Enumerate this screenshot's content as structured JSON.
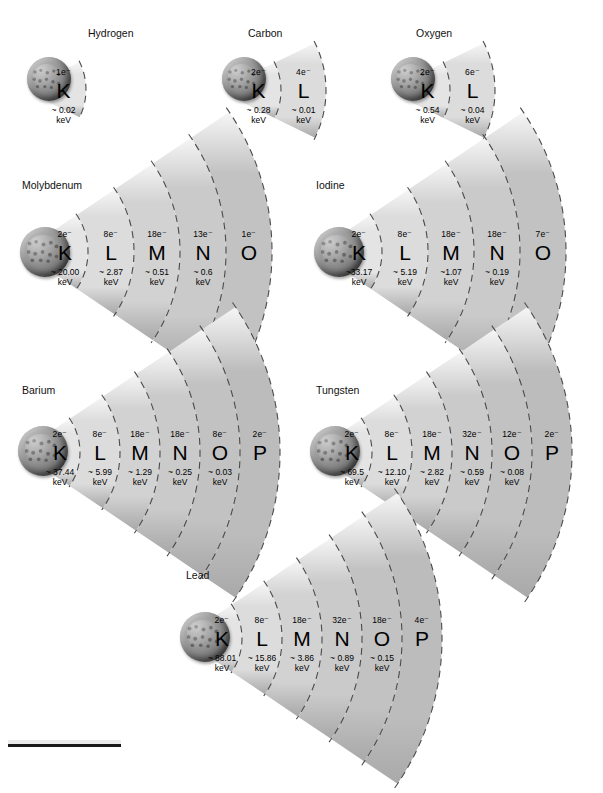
{
  "figure": {
    "type": "diagram",
    "units": "keV",
    "electron_symbol": "e⁻",
    "approx_symbol": "~",
    "energy_unit_label": "keV"
  },
  "elements": [
    {
      "name": "Hydrogen",
      "label_x": 88,
      "label_y": 28,
      "origin_x": 18,
      "origin_y": 92,
      "nucleus": {
        "x": 27,
        "y": 57,
        "size": 44
      },
      "fan": {
        "r_inner": 18,
        "r_step": 45,
        "half_angle": 26,
        "cx": 23,
        "cy": 90
      },
      "shells": [
        {
          "letter": "K",
          "electrons": "1e⁻",
          "energy": "~ 0.02",
          "unit": "keV"
        }
      ]
    },
    {
      "name": "Carbon",
      "label_x": 248,
      "label_y": 28,
      "origin_x": 178,
      "origin_y": 92,
      "nucleus": {
        "x": 222,
        "y": 57,
        "size": 44
      },
      "fan": {
        "r_inner": 18,
        "r_step": 45,
        "half_angle": 26,
        "cx": 218,
        "cy": 90
      },
      "shells": [
        {
          "letter": "K",
          "electrons": "2e⁻",
          "energy": "~ 0.28",
          "unit": "keV"
        },
        {
          "letter": "L",
          "electrons": "4e⁻",
          "energy": "~ 0.01",
          "unit": "keV"
        }
      ]
    },
    {
      "name": "Oxygen",
      "label_x": 416,
      "label_y": 28,
      "origin_x": 346,
      "origin_y": 92,
      "nucleus": {
        "x": 391,
        "y": 57,
        "size": 44
      },
      "fan": {
        "r_inner": 18,
        "r_step": 45,
        "half_angle": 26,
        "cx": 387,
        "cy": 90
      },
      "shells": [
        {
          "letter": "K",
          "electrons": "2e⁻",
          "energy": "~ 0.54",
          "unit": "keV"
        },
        {
          "letter": "L",
          "electrons": "6e⁻",
          "energy": "~ 0.04",
          "unit": "keV"
        }
      ]
    },
    {
      "name": "Molybdenum",
      "label_x": 22,
      "label_y": 180,
      "origin_x": 18,
      "origin_y": 262,
      "nucleus": {
        "x": 20,
        "y": 227,
        "size": 50
      },
      "fan": {
        "r_inner": 20,
        "r_step": 46,
        "half_angle": 34,
        "cx": 22,
        "cy": 252
      },
      "shells": [
        {
          "letter": "K",
          "electrons": "2e⁻",
          "energy": "~ 20.00",
          "unit": "keV"
        },
        {
          "letter": "L",
          "electrons": "8e⁻",
          "energy": "~ 2.87",
          "unit": "keV"
        },
        {
          "letter": "M",
          "electrons": "18e⁻",
          "energy": "~ 0.51",
          "unit": "keV"
        },
        {
          "letter": "N",
          "electrons": "13e⁻",
          "energy": "~ 0.6",
          "unit": "keV"
        },
        {
          "letter": "O",
          "electrons": "1e⁻",
          "energy": "",
          "unit": ""
        }
      ]
    },
    {
      "name": "Iodine",
      "label_x": 316,
      "label_y": 180,
      "origin_x": 312,
      "origin_y": 262,
      "nucleus": {
        "x": 314,
        "y": 227,
        "size": 50
      },
      "fan": {
        "r_inner": 20,
        "r_step": 46,
        "half_angle": 34,
        "cx": 316,
        "cy": 252
      },
      "shells": [
        {
          "letter": "K",
          "electrons": "2e⁻",
          "energy": "~33.17",
          "unit": "keV"
        },
        {
          "letter": "L",
          "electrons": "8e⁻",
          "energy": "~ 5.19",
          "unit": "keV"
        },
        {
          "letter": "M",
          "electrons": "18e⁻",
          "energy": "~1.07",
          "unit": "keV"
        },
        {
          "letter": "N",
          "electrons": "18e⁻",
          "energy": "~ 0.19",
          "unit": "keV"
        },
        {
          "letter": "O",
          "electrons": "7e⁻",
          "energy": "",
          "unit": ""
        }
      ]
    },
    {
      "name": "Barium",
      "label_x": 22,
      "label_y": 385,
      "origin_x": 18,
      "origin_y": 462,
      "nucleus": {
        "x": 18,
        "y": 426,
        "size": 50
      },
      "fan": {
        "r_inner": 20,
        "r_step": 40,
        "half_angle": 34,
        "cx": 20,
        "cy": 452
      },
      "shells": [
        {
          "letter": "K",
          "electrons": "2e⁻",
          "energy": "~ 37.44",
          "unit": "keV"
        },
        {
          "letter": "L",
          "electrons": "8e⁻",
          "energy": "~ 5.99",
          "unit": "keV"
        },
        {
          "letter": "M",
          "electrons": "18e⁻",
          "energy": "~ 1.29",
          "unit": "keV"
        },
        {
          "letter": "N",
          "electrons": "18e⁻",
          "energy": "~ 0.25",
          "unit": "keV"
        },
        {
          "letter": "O",
          "electrons": "8e⁻",
          "energy": "~ 0.03",
          "unit": "keV"
        },
        {
          "letter": "P",
          "electrons": "2e⁻",
          "energy": "",
          "unit": ""
        }
      ]
    },
    {
      "name": "Tungsten",
      "label_x": 316,
      "label_y": 385,
      "origin_x": 312,
      "origin_y": 462,
      "nucleus": {
        "x": 310,
        "y": 426,
        "size": 50
      },
      "fan": {
        "r_inner": 20,
        "r_step": 40,
        "half_angle": 34,
        "cx": 312,
        "cy": 452
      },
      "shells": [
        {
          "letter": "K",
          "electrons": "2e⁻",
          "energy": "~ 69.5",
          "unit": "keV"
        },
        {
          "letter": "L",
          "electrons": "8e⁻",
          "energy": "~ 12.10",
          "unit": "keV"
        },
        {
          "letter": "M",
          "electrons": "18e⁻",
          "energy": "~ 2.82",
          "unit": "keV"
        },
        {
          "letter": "N",
          "electrons": "32e⁻",
          "energy": "~ 0.59",
          "unit": "keV"
        },
        {
          "letter": "O",
          "electrons": "12e⁻",
          "energy": "~ 0.08",
          "unit": "keV"
        },
        {
          "letter": "P",
          "electrons": "2e⁻",
          "energy": "",
          "unit": ""
        }
      ]
    },
    {
      "name": "Lead",
      "label_x": 186,
      "label_y": 570,
      "origin_x": 182,
      "origin_y": 648,
      "nucleus": {
        "x": 180,
        "y": 612,
        "size": 50
      },
      "fan": {
        "r_inner": 20,
        "r_step": 40,
        "half_angle": 34,
        "cx": 182,
        "cy": 638
      },
      "shells": [
        {
          "letter": "K",
          "electrons": "2e⁻",
          "energy": "~ 88.01",
          "unit": "keV"
        },
        {
          "letter": "L",
          "electrons": "8e⁻",
          "energy": "~ 15.86",
          "unit": "keV"
        },
        {
          "letter": "M",
          "electrons": "18e⁻",
          "energy": "~ 3.86",
          "unit": "keV"
        },
        {
          "letter": "N",
          "electrons": "32e⁻",
          "energy": "~ 0.89",
          "unit": "keV"
        },
        {
          "letter": "O",
          "electrons": "18e⁻",
          "energy": "~ 0.15",
          "unit": "keV"
        },
        {
          "letter": "P",
          "electrons": "4e⁻",
          "energy": "",
          "unit": ""
        }
      ]
    }
  ],
  "style": {
    "shell_fills": [
      "#e4e4e4",
      "#dcdcdc",
      "#d2d2d2",
      "#cacaca",
      "#c2c2c2",
      "#bcbcbc"
    ],
    "divider_color": "#4a4a4a",
    "text_color": "#111111",
    "background": "#ffffff"
  }
}
